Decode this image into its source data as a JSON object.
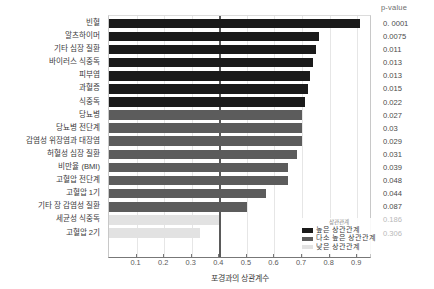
{
  "pvalue_header": "p-value",
  "legend": {
    "title": "상관관계",
    "items": [
      {
        "label": "높은 상관관계",
        "color": "#1a1a1a"
      },
      {
        "label": "다소 높은 상관관계",
        "color": "#5c5c5c"
      },
      {
        "label": "낮은 상관관계",
        "color": "#e2e2e2"
      }
    ]
  },
  "colors": {
    "high": "#1a1a1a",
    "medium": "#5c5c5c",
    "low": "#e2e2e2",
    "reference_line": "#5a5a5a",
    "gridline": "#e6e6e6"
  },
  "chart_data": {
    "type": "bar",
    "orientation": "horizontal",
    "title": "",
    "xlabel": "포경과의 상관계수",
    "ylabel": "",
    "xlim": [
      0,
      0.95
    ],
    "xticks": [
      0.1,
      0.2,
      0.3,
      0.4,
      0.5,
      0.6,
      0.7,
      0.8,
      0.9
    ],
    "xticklabels": [
      "0.1",
      "0.2",
      "0.3",
      "0.4",
      "0.5",
      "0.6",
      "0.7",
      "0.8",
      "0.9"
    ],
    "grid": true,
    "reference_line_x": 0.4,
    "legend_position": "bottom-right",
    "categories": [
      "빈혈",
      "알츠하이머",
      "기타 심장 질환",
      "바이러스 식중독",
      "피부염",
      "과혈증",
      "식중독",
      "당뇨병",
      "당뇨병 전단계",
      "감염성 위장염과 대장염",
      "허혈성 심장 질환",
      "비만율 (BMI)",
      "고혈압 전단계",
      "고혈압 1기",
      "기타 장 감염성 질환",
      "세균성 식중독",
      "고혈압 2기"
    ],
    "values": [
      0.91,
      0.76,
      0.75,
      0.74,
      0.73,
      0.72,
      0.71,
      0.7,
      0.7,
      0.7,
      0.68,
      0.65,
      0.65,
      0.57,
      0.5,
      0.4,
      0.33
    ],
    "pvalues": [
      "0. 0001",
      "0.0075",
      "0.011",
      "0.013",
      "0.013",
      "0.015",
      "0.022",
      "0.027",
      "0.03",
      "0.029",
      "0.031",
      "0.039",
      "0.048",
      "0.044",
      "0.087",
      "0.186",
      "0.306"
    ],
    "groups": [
      "high",
      "high",
      "high",
      "high",
      "high",
      "high",
      "high",
      "medium",
      "medium",
      "medium",
      "medium",
      "medium",
      "medium",
      "medium",
      "medium",
      "low",
      "low"
    ]
  }
}
